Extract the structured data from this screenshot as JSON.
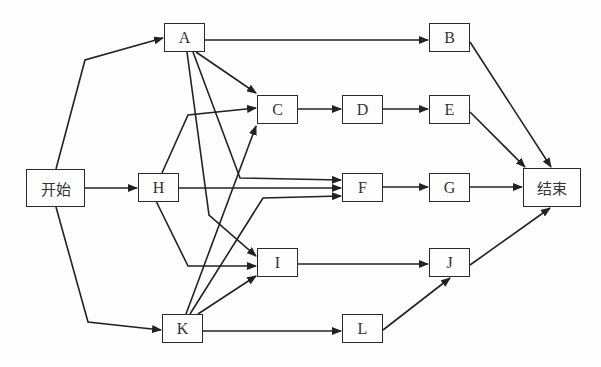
{
  "diagram": {
    "type": "activity-network",
    "colors": {
      "stroke": "#222222",
      "background": "#fdfdfd",
      "text": "#333333"
    },
    "nodes": [
      {
        "id": "start",
        "label": "开始",
        "x": 26,
        "y": 169,
        "w": 59,
        "h": 38
      },
      {
        "id": "A",
        "label": "A",
        "x": 164,
        "y": 23,
        "w": 41,
        "h": 29
      },
      {
        "id": "B",
        "label": "B",
        "x": 429,
        "y": 23,
        "w": 41,
        "h": 29
      },
      {
        "id": "C",
        "label": "C",
        "x": 257,
        "y": 95,
        "w": 41,
        "h": 29
      },
      {
        "id": "D",
        "label": "D",
        "x": 342,
        "y": 95,
        "w": 41,
        "h": 29
      },
      {
        "id": "E",
        "label": "E",
        "x": 429,
        "y": 95,
        "w": 41,
        "h": 29
      },
      {
        "id": "H",
        "label": "H",
        "x": 138,
        "y": 173,
        "w": 41,
        "h": 29
      },
      {
        "id": "F",
        "label": "F",
        "x": 342,
        "y": 173,
        "w": 41,
        "h": 29
      },
      {
        "id": "G",
        "label": "G",
        "x": 429,
        "y": 173,
        "w": 41,
        "h": 29
      },
      {
        "id": "end",
        "label": "结束",
        "x": 523,
        "y": 168,
        "w": 58,
        "h": 39
      },
      {
        "id": "I",
        "label": "I",
        "x": 257,
        "y": 248,
        "w": 41,
        "h": 29
      },
      {
        "id": "J",
        "label": "J",
        "x": 429,
        "y": 248,
        "w": 41,
        "h": 29
      },
      {
        "id": "K",
        "label": "K",
        "x": 162,
        "y": 314,
        "w": 41,
        "h": 29
      },
      {
        "id": "L",
        "label": "L",
        "x": 342,
        "y": 314,
        "w": 41,
        "h": 29
      }
    ],
    "edges": [
      {
        "from": "start",
        "to": "A",
        "points": [
          [
            56,
            169
          ],
          [
            85,
            60
          ],
          [
            163,
            38
          ]
        ]
      },
      {
        "from": "start",
        "to": "H",
        "points": [
          [
            85,
            188
          ],
          [
            137,
            188
          ]
        ]
      },
      {
        "from": "start",
        "to": "K",
        "points": [
          [
            56,
            207
          ],
          [
            88,
            322
          ],
          [
            161,
            330
          ]
        ]
      },
      {
        "from": "A",
        "to": "B",
        "points": [
          [
            205,
            40
          ],
          [
            428,
            40
          ]
        ]
      },
      {
        "from": "A",
        "to": "C",
        "points": [
          [
            196,
            52
          ],
          [
            256,
            93
          ]
        ]
      },
      {
        "from": "A",
        "to": "F",
        "points": [
          [
            193,
            52
          ],
          [
            240,
            178
          ],
          [
            341,
            180
          ]
        ]
      },
      {
        "from": "A",
        "to": "I",
        "points": [
          [
            187,
            52
          ],
          [
            209,
            215
          ],
          [
            256,
            256
          ]
        ]
      },
      {
        "from": "H",
        "to": "C",
        "points": [
          [
            162,
            173
          ],
          [
            188,
            115
          ],
          [
            256,
            108
          ]
        ]
      },
      {
        "from": "H",
        "to": "F",
        "points": [
          [
            179,
            188
          ],
          [
            341,
            188
          ]
        ]
      },
      {
        "from": "H",
        "to": "I",
        "points": [
          [
            156,
            201
          ],
          [
            188,
            266
          ],
          [
            256,
            266
          ]
        ]
      },
      {
        "from": "K",
        "to": "C",
        "points": [
          [
            186,
            314
          ],
          [
            256,
            126
          ]
        ]
      },
      {
        "from": "K",
        "to": "F",
        "points": [
          [
            190,
            314
          ],
          [
            263,
            198
          ],
          [
            341,
            196
          ]
        ]
      },
      {
        "from": "K",
        "to": "I",
        "points": [
          [
            198,
            314
          ],
          [
            256,
            276
          ]
        ]
      },
      {
        "from": "K",
        "to": "L",
        "points": [
          [
            203,
            331
          ],
          [
            341,
            331
          ]
        ]
      },
      {
        "from": "C",
        "to": "D",
        "points": [
          [
            298,
            109
          ],
          [
            341,
            109
          ]
        ]
      },
      {
        "from": "D",
        "to": "E",
        "points": [
          [
            383,
            109
          ],
          [
            428,
            109
          ]
        ]
      },
      {
        "from": "F",
        "to": "G",
        "points": [
          [
            383,
            187
          ],
          [
            428,
            187
          ]
        ]
      },
      {
        "from": "I",
        "to": "J",
        "points": [
          [
            298,
            264
          ],
          [
            428,
            264
          ]
        ]
      },
      {
        "from": "L",
        "to": "J",
        "points": [
          [
            383,
            330
          ],
          [
            450,
            278
          ]
        ]
      },
      {
        "from": "B",
        "to": "end",
        "points": [
          [
            470,
            42
          ],
          [
            551,
            167
          ]
        ]
      },
      {
        "from": "E",
        "to": "end",
        "points": [
          [
            470,
            112
          ],
          [
            525,
            167
          ]
        ]
      },
      {
        "from": "G",
        "to": "end",
        "points": [
          [
            470,
            187
          ],
          [
            522,
            187
          ]
        ]
      },
      {
        "from": "J",
        "to": "end",
        "points": [
          [
            470,
            265
          ],
          [
            550,
            208
          ]
        ]
      }
    ]
  }
}
